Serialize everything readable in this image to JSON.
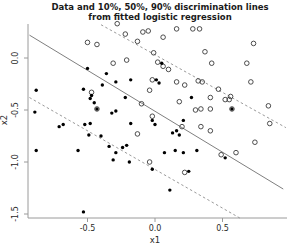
{
  "title": {
    "line1": "Data and 10%, 50%, 90% discrimination lines",
    "line2": "from fitted logistic regression"
  },
  "colors": {
    "background": "#ffffff",
    "title_text": "#1a1a1a",
    "axis_line": "#9a9a9a",
    "tick_text": "#2a2a2a",
    "solid_line": "#7f7f7f",
    "dashed_line": "#9a9a9a",
    "open_marker_stroke": "#3a3a3a",
    "filled_marker": "#000000"
  },
  "chart_data": {
    "type": "scatter",
    "title": "Data and 10%, 50%, 90% discrimination lines from fitted logistic regression",
    "xlabel": "x1",
    "ylabel": "x2",
    "xlim": [
      -0.95,
      0.98
    ],
    "ylim": [
      -1.55,
      0.37
    ],
    "grid": false,
    "legend": "none",
    "x_ticks": {
      "values": [
        -0.5,
        0.0,
        0.5
      ],
      "labels": [
        "-0.5",
        "0.0",
        "0.5"
      ]
    },
    "y_ticks": {
      "values": [
        0.0,
        -0.5,
        -1.0,
        -1.5
      ],
      "labels": [
        "0.0",
        "-0.5",
        "-1.0",
        "-1.5"
      ]
    },
    "lines": [
      {
        "name": "10% discrimination line",
        "style": "dashed",
        "slope": -0.72,
        "intercept": 0.03,
        "from": [
          -0.4,
          0.32
        ],
        "to": [
          0.97,
          -0.67
        ]
      },
      {
        "name": "50% discrimination line",
        "style": "solid",
        "slope": -0.79,
        "intercept": -0.51,
        "from": [
          -0.93,
          0.22
        ],
        "to": [
          0.95,
          -1.26
        ]
      },
      {
        "name": "90% discrimination line",
        "style": "dashed",
        "slope": -0.74,
        "intercept": -1.07,
        "from": [
          -0.93,
          -0.38
        ],
        "to": [
          0.63,
          -1.54
        ]
      }
    ],
    "series": [
      {
        "name": "class 0 (open circles)",
        "marker": "open-circle",
        "points": [
          [
            -0.5,
            0.15
          ],
          [
            -0.43,
            0.13
          ],
          [
            -0.47,
            -0.33
          ],
          [
            -0.43,
            -0.49
          ],
          [
            -0.28,
            0.33
          ],
          [
            -0.22,
            0.23
          ],
          [
            -0.09,
            0.25
          ],
          [
            -0.05,
            0.26
          ],
          [
            -0.13,
            0.16
          ],
          [
            -0.01,
            0.05
          ],
          [
            0.06,
            0.2
          ],
          [
            0.16,
            0.28
          ],
          [
            0.28,
            0.28
          ],
          [
            0.33,
            0.28
          ],
          [
            0.02,
            -0.04
          ],
          [
            0.06,
            -0.08
          ],
          [
            0.1,
            -0.11
          ],
          [
            -0.21,
            -0.02
          ],
          [
            -0.31,
            -0.05
          ],
          [
            -0.02,
            -0.21
          ],
          [
            0.16,
            -0.23
          ],
          [
            0.22,
            -0.26
          ],
          [
            -0.04,
            -0.31
          ],
          [
            0.18,
            -0.42
          ],
          [
            -0.1,
            -0.44
          ],
          [
            0.3,
            -0.5
          ],
          [
            -0.02,
            -0.56
          ],
          [
            0.73,
            0.14
          ],
          [
            0.37,
            0.06
          ],
          [
            0.42,
            -0.05
          ],
          [
            0.68,
            -0.05
          ],
          [
            0.32,
            -0.22
          ],
          [
            0.35,
            -0.23
          ],
          [
            0.47,
            -0.3
          ],
          [
            0.71,
            -0.23
          ],
          [
            0.41,
            -0.38
          ],
          [
            0.52,
            -0.4
          ],
          [
            0.55,
            -0.4
          ],
          [
            0.56,
            -0.37
          ],
          [
            0.34,
            -0.49
          ],
          [
            0.41,
            -0.49
          ],
          [
            0.57,
            -0.49
          ],
          [
            0.84,
            -0.46
          ],
          [
            0.2,
            -0.66
          ],
          [
            0.34,
            -0.66
          ],
          [
            0.41,
            -0.7
          ],
          [
            -0.13,
            -0.73
          ],
          [
            -0.04,
            -1.0
          ],
          [
            0.22,
            -1.1
          ],
          [
            0.49,
            -0.93
          ],
          [
            0.6,
            -0.91
          ],
          [
            0.74,
            -0.81
          ],
          [
            0.85,
            -0.63
          ]
        ]
      },
      {
        "name": "class 1 (filled dots)",
        "marker": "filled-dot",
        "points": [
          [
            -0.5,
            -0.1
          ],
          [
            -0.36,
            -0.15
          ],
          [
            -0.88,
            -0.31
          ],
          [
            -0.53,
            -0.3
          ],
          [
            -0.47,
            -0.36
          ],
          [
            -0.39,
            -0.26
          ],
          [
            -0.48,
            -0.39
          ],
          [
            -0.45,
            -0.43
          ],
          [
            -0.43,
            -0.49
          ],
          [
            -0.89,
            -0.52
          ],
          [
            0.05,
            -0.05
          ],
          [
            -0.29,
            -0.23
          ],
          [
            -0.18,
            -0.21
          ],
          [
            0.01,
            -0.21
          ],
          [
            0.03,
            -0.24
          ],
          [
            -0.22,
            -0.38
          ],
          [
            -0.32,
            -0.53
          ],
          [
            -0.29,
            -0.51
          ],
          [
            0.27,
            -0.38
          ],
          [
            0.57,
            -0.49
          ],
          [
            -0.71,
            -0.66
          ],
          [
            -0.68,
            -0.64
          ],
          [
            -0.52,
            -0.64
          ],
          [
            -0.48,
            -0.63
          ],
          [
            -0.49,
            -0.74
          ],
          [
            -0.4,
            -0.75
          ],
          [
            -0.88,
            -0.89
          ],
          [
            -0.57,
            -0.89
          ],
          [
            -0.34,
            -0.85
          ],
          [
            -0.18,
            -0.63
          ],
          [
            0.0,
            -0.64
          ],
          [
            -0.02,
            -0.6
          ],
          [
            0.21,
            -0.6
          ],
          [
            0.13,
            -0.72
          ],
          [
            0.16,
            -0.7
          ],
          [
            0.18,
            -0.74
          ],
          [
            -0.21,
            -0.84
          ],
          [
            -0.24,
            -0.86
          ],
          [
            -0.29,
            -0.91
          ],
          [
            -0.31,
            -0.98
          ],
          [
            -0.19,
            -1.0
          ],
          [
            0.07,
            -0.91
          ],
          [
            0.15,
            -0.89
          ],
          [
            0.21,
            -0.91
          ],
          [
            0.31,
            -0.89
          ],
          [
            0.52,
            -0.96
          ],
          [
            -0.02,
            -1.07
          ],
          [
            0.25,
            -1.09
          ],
          [
            0.11,
            -1.27
          ],
          [
            -0.53,
            -1.48
          ]
        ]
      }
    ]
  }
}
